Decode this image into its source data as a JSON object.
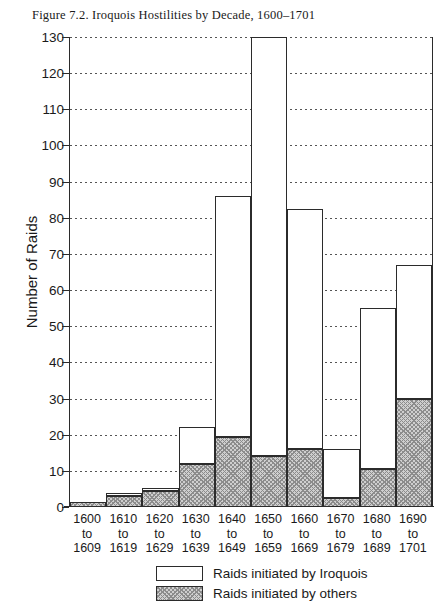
{
  "figure": {
    "title": "Figure 7.2. Iroquois Hostilities by Decade, 1600–1701"
  },
  "chart_data": {
    "type": "bar",
    "stacked": true,
    "title": "Figure 7.2. Iroquois Hostilities by Decade, 1600–1701",
    "xlabel": "",
    "ylabel": "Number of Raids",
    "ylim": [
      0,
      130
    ],
    "ytick_step": 10,
    "yticks": [
      0,
      10,
      20,
      30,
      40,
      50,
      60,
      70,
      80,
      90,
      100,
      110,
      120,
      130
    ],
    "ytick_labels": [
      "0",
      "10",
      "20",
      "30",
      "40",
      "50",
      "60",
      "70",
      "80",
      "90",
      "100",
      "110",
      "120",
      "130"
    ],
    "grid": "horizontal-dotted",
    "legend_position": "bottom-center",
    "categories": [
      "1600\nto\n1609",
      "1610\nto\n1619",
      "1620\nto\n1629",
      "1630\nto\n1639",
      "1640\nto\n1649",
      "1650\nto\n1659",
      "1660\nto\n1669",
      "1670\nto\n1679",
      "1680\nto\n1689",
      "1690\nto\n1701"
    ],
    "category_lines": [
      [
        "1600",
        "to",
        "1609"
      ],
      [
        "1610",
        "to",
        "1619"
      ],
      [
        "1620",
        "to",
        "1629"
      ],
      [
        "1630",
        "to",
        "1639"
      ],
      [
        "1640",
        "to",
        "1649"
      ],
      [
        "1650",
        "to",
        "1659"
      ],
      [
        "1660",
        "to",
        "1669"
      ],
      [
        "1670",
        "to",
        "1679"
      ],
      [
        "1680",
        "to",
        "1689"
      ],
      [
        "1690",
        "to",
        "1701"
      ]
    ],
    "series": [
      {
        "name": "Raids initiated by others",
        "key": "others",
        "fill": "stipple-hatch",
        "color": "#cfcfcf",
        "values": [
          1.5,
          3,
          4.5,
          12,
          19.5,
          14,
          16,
          2.5,
          10.5,
          30
        ]
      },
      {
        "name": "Raids initiated by Iroquois",
        "key": "iroquois",
        "fill": "solid-white",
        "color": "#ffffff",
        "values": [
          0,
          1,
          0.5,
          10,
          66.5,
          116,
          66.5,
          13.5,
          44.5,
          37
        ]
      }
    ],
    "totals": [
      1.5,
      4,
      5,
      22,
      86,
      130,
      82.5,
      16,
      55,
      67
    ]
  },
  "legend": {
    "items": [
      {
        "label": "Raids initiated by Iroquois",
        "key": "iroquois"
      },
      {
        "label": "Raids initiated by others",
        "key": "others"
      }
    ]
  }
}
